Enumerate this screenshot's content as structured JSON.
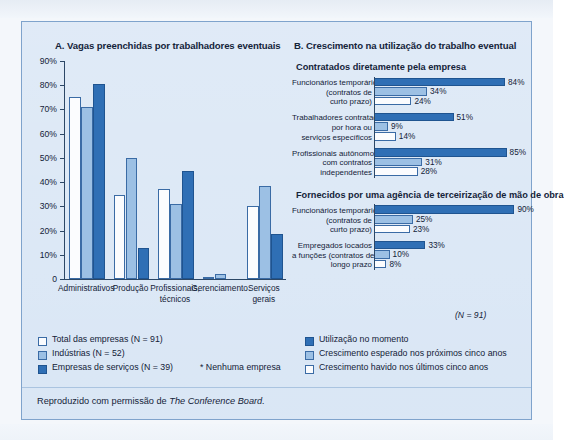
{
  "figure": {
    "background_color": "#d9e6f5",
    "border_color": "#7fa3cc",
    "caption_prefix": "Reproduzido com permissão de ",
    "caption_source": "The Conference Board."
  },
  "colors": {
    "white_series": "#fbfcfe",
    "light_series": "#9cc0e4",
    "dark_series": "#2f6fb5",
    "outline": "#3a6ba5",
    "axis": "#2c4766",
    "text": "#132238"
  },
  "chart_data": [
    {
      "id": "panel-a",
      "type": "bar",
      "title": "A. Vagas preenchidas por trabalhadores eventuais",
      "xlabel": "",
      "ylabel": "",
      "ylim": [
        0,
        90
      ],
      "ytick_labels": [
        "0",
        "10%",
        "20%",
        "30%",
        "40%",
        "50%",
        "60%",
        "70%",
        "80%",
        "90%"
      ],
      "ytick_values": [
        0,
        10,
        20,
        30,
        40,
        50,
        60,
        70,
        80,
        90
      ],
      "grid": false,
      "legend_position": "below-left",
      "categories": [
        "Administrativos",
        "Produção",
        "Profissionais,\ntécnicos",
        "Gerenciamento",
        "Serviços\ngerais"
      ],
      "categories_lines": [
        [
          "Administrativos"
        ],
        [
          "Produção"
        ],
        [
          "Profissionais,",
          "técnicos"
        ],
        [
          "Gerenciamento"
        ],
        [
          "Serviços",
          "gerais"
        ]
      ],
      "series": [
        {
          "name": "Total das empresas (N = 91)",
          "color_key": "white_series",
          "values": [
            75,
            34.5,
            37,
            1,
            30
          ]
        },
        {
          "name": "Indústrias (N = 52)",
          "color_key": "light_series",
          "values": [
            71,
            50,
            31,
            2,
            38.5
          ]
        },
        {
          "name": "Empresas de serviços (N = 39)",
          "color_key": "dark_series",
          "values": [
            80.5,
            13,
            44.5,
            0,
            18.5
          ]
        }
      ],
      "legend": [
        {
          "swatch": "white",
          "label": "Total das empresas (N = 91)"
        },
        {
          "swatch": "light",
          "label": "Indústrias (N = 52)"
        },
        {
          "swatch": "dark",
          "label": "Empresas de serviços (N = 39)"
        }
      ],
      "footnote": "* Nenhuma empresa"
    },
    {
      "id": "panel-b",
      "type": "bar",
      "orientation": "horizontal",
      "title": "B. Crescimento na utilização do trabalho eventual",
      "xlim": [
        0,
        100
      ],
      "grid": false,
      "legend_position": "below",
      "sample_note": "(N = 91)",
      "sections": [
        {
          "heading": "Contratados diretamente pela empresa",
          "groups": [
            {
              "label_lines": [
                "Funcionários temporários",
                "(contratos de",
                "curto prazo)"
              ],
              "bars": [
                {
                  "series": "Utilização no momento",
                  "color_key": "dark_series",
                  "value": 84,
                  "value_label": "84%"
                },
                {
                  "series": "Crescimento esperado nos próximos cinco anos",
                  "color_key": "light_series",
                  "value": 34,
                  "value_label": "34%"
                },
                {
                  "series": "Crescimento havido nos últimos cinco anos",
                  "color_key": "white_series",
                  "value": 24,
                  "value_label": "24%"
                }
              ]
            },
            {
              "label_lines": [
                "Trabalhadores contratados",
                "por hora ou",
                "serviços específicos"
              ],
              "bars": [
                {
                  "series": "Utilização no momento",
                  "color_key": "dark_series",
                  "value": 51,
                  "value_label": "51%"
                },
                {
                  "series": "Crescimento esperado nos próximos cinco anos",
                  "color_key": "light_series",
                  "value": 9,
                  "value_label": "9%"
                },
                {
                  "series": "Crescimento havido nos últimos cinco anos",
                  "color_key": "white_series",
                  "value": 14,
                  "value_label": "14%"
                }
              ]
            },
            {
              "label_lines": [
                "Profissionais autônomos",
                "com contratos",
                "independentes"
              ],
              "bars": [
                {
                  "series": "Utilização no momento",
                  "color_key": "dark_series",
                  "value": 85,
                  "value_label": "85%"
                },
                {
                  "series": "Crescimento esperado nos próximos cinco anos",
                  "color_key": "light_series",
                  "value": 31,
                  "value_label": "31%"
                },
                {
                  "series": "Crescimento havido nos últimos cinco anos",
                  "color_key": "white_series",
                  "value": 28,
                  "value_label": "28%"
                }
              ]
            }
          ]
        },
        {
          "heading": "Fornecidos por uma agência de terceirização de mão de obra",
          "groups": [
            {
              "label_lines": [
                "Funcionários temporários",
                "(contratos de",
                "curto prazo)"
              ],
              "bars": [
                {
                  "series": "Utilização no momento",
                  "color_key": "dark_series",
                  "value": 90,
                  "value_label": "90%"
                },
                {
                  "series": "Crescimento esperado nos próximos cinco anos",
                  "color_key": "light_series",
                  "value": 25,
                  "value_label": "25%"
                },
                {
                  "series": "Crescimento havido nos últimos cinco anos",
                  "color_key": "white_series",
                  "value": 23,
                  "value_label": "23%"
                }
              ]
            },
            {
              "label_lines": [
                "Empregados locados",
                "a funções (contratos de",
                "longo prazo"
              ],
              "bars": [
                {
                  "series": "Utilização no momento",
                  "color_key": "dark_series",
                  "value": 33,
                  "value_label": "33%"
                },
                {
                  "series": "Crescimento esperado nos próximos cinco anos",
                  "color_key": "light_series",
                  "value": 10,
                  "value_label": "10%"
                },
                {
                  "series": "Crescimento havido nos últimos cinco anos",
                  "color_key": "white_series",
                  "value": 8,
                  "value_label": "8%"
                }
              ]
            }
          ]
        }
      ],
      "legend": [
        {
          "swatch": "dark",
          "label": "Utilização no momento"
        },
        {
          "swatch": "light",
          "label": "Crescimento esperado nos próximos cinco anos"
        },
        {
          "swatch": "white",
          "label": "Crescimento havido nos últimos cinco anos"
        }
      ]
    }
  ]
}
